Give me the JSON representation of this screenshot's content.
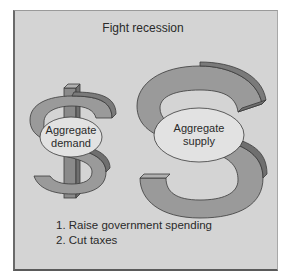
{
  "diagram": {
    "title": "Fight recession",
    "symbols": [
      {
        "glyph": "$",
        "label_line1": "Aggregate",
        "label_line2": "demand"
      },
      {
        "glyph": "S",
        "label_line1": "Aggregate",
        "label_line2": "supply"
      }
    ],
    "actions": [
      "1. Raise government spending",
      "2. Cut taxes"
    ],
    "colors": {
      "background": "#d4d4d4",
      "symbol_face": "#9a9a9a",
      "symbol_side": "#6f6f6f",
      "ellipse_fill": "#e2e2e2",
      "outline": "#3a3a3a"
    }
  }
}
